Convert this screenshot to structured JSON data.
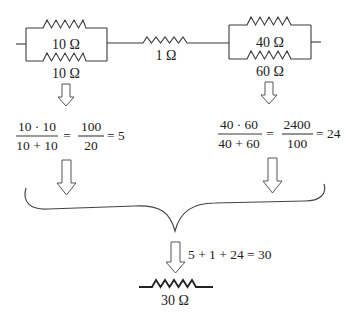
{
  "circuit": {
    "left_parallel": {
      "top_resistor_label": "10 Ω",
      "bottom_resistor_label": "10 Ω"
    },
    "series_resistor_label": "1 Ω",
    "right_parallel": {
      "top_resistor_label": "40 Ω",
      "bottom_resistor_label": "60 Ω"
    }
  },
  "calculations": {
    "left": {
      "numerator": "10 · 10",
      "denominator": "10 + 10",
      "equals_1": "=",
      "result_numerator": "100",
      "result_denominator": "20",
      "equals_2": "= 5"
    },
    "right": {
      "numerator": "40 · 60",
      "denominator": "40 + 60",
      "equals_1": "=",
      "result_numerator": "2400",
      "result_denominator": "100",
      "equals_2": "= 24"
    }
  },
  "total": {
    "sum_equation": "5 + 1 + 24 = 30",
    "equivalent_resistor_label": "30 Ω"
  },
  "colors": {
    "line": "#3a3a3a",
    "text": "#222222",
    "background": "#ffffff"
  }
}
